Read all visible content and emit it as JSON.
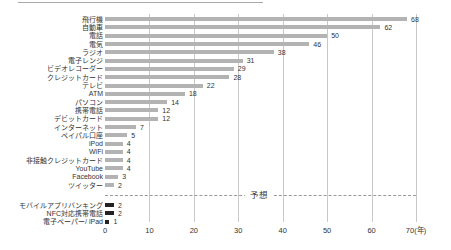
{
  "decor": {
    "top_rule_color": "#aaaaaa"
  },
  "chart_data": {
    "type": "bar",
    "orientation": "horizontal",
    "title": "",
    "xlabel": "",
    "ylabel": "",
    "unit": "年",
    "xlim": [
      0,
      70
    ],
    "grid": true,
    "x_tick_values": [
      0,
      10,
      20,
      30,
      40,
      50,
      60,
      70
    ],
    "x_tick_labels": [
      "0",
      "10",
      "20",
      "30",
      "40",
      "50",
      "60",
      "70(年)"
    ],
    "annotation": "予想",
    "colors": {
      "bar": "#b3b3b3",
      "forecast_bar": "#222222",
      "gridline": "#c9c9c9",
      "dashed_line": "#999999",
      "text": "#333333"
    },
    "series": [
      {
        "name": "",
        "items": [
          {
            "label": "飛行機",
            "value": 68
          },
          {
            "label": "自動車",
            "value": 62
          },
          {
            "label": "電話",
            "value": 50
          },
          {
            "label": "電気",
            "value": 46
          },
          {
            "label": "ラジオ",
            "value": 38
          },
          {
            "label": "電子レンジ",
            "value": 31
          },
          {
            "label": "ビデオレコーダー",
            "value": 29
          },
          {
            "label": "クレジットカード",
            "value": 28
          },
          {
            "label": "テレビ",
            "value": 22
          },
          {
            "label": "ATM",
            "value": 18
          },
          {
            "label": "パソコン",
            "value": 14
          },
          {
            "label": "携帯電話",
            "value": 12
          },
          {
            "label": "デビットカード",
            "value": 12
          },
          {
            "label": "インターネット",
            "value": 7
          },
          {
            "label": "ペイパル口座",
            "value": 5
          },
          {
            "label": "iPod",
            "value": 4
          },
          {
            "label": "WiFi",
            "value": 4
          },
          {
            "label": "非接触クレジットカード",
            "value": 4
          },
          {
            "label": "YouTube",
            "value": 4
          },
          {
            "label": "Facebook",
            "value": 3
          },
          {
            "label": "ツイッター",
            "value": 2
          }
        ]
      },
      {
        "name": "予想",
        "items": [
          {
            "label": "モバイルアプリバンキング",
            "value": 2
          },
          {
            "label": "NFC対応携帯電話",
            "value": 2
          },
          {
            "label": "電子ペーパー/ iPad",
            "value": 1
          }
        ]
      }
    ]
  }
}
